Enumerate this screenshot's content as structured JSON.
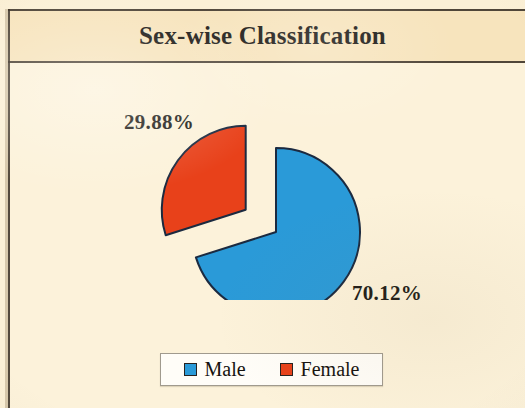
{
  "title": "Sex-wise Classification",
  "colors": {
    "male": "#2a9ad8",
    "female": "#e8411a",
    "slice_outline": "#1b2a40",
    "title_band_bg": "#f7e4bd",
    "plot_bg": "#fcf2da",
    "frame_rule": "#3d3328",
    "legend_bg": "#fffdf8",
    "legend_border": "#a09a8e",
    "text": "#1d1a16"
  },
  "labels": {
    "female_pct": "29.88%",
    "male_pct": "70.12%"
  },
  "legend": {
    "items": [
      {
        "label": "Male",
        "color": "#2a9ad8"
      },
      {
        "label": "Female",
        "color": "#e8411a"
      }
    ]
  },
  "chart_data": {
    "type": "pie",
    "title": "Sex-wise Classification",
    "xlabel": "",
    "ylabel": "",
    "categories": [
      "Male",
      "Female"
    ],
    "values": [
      70.12,
      29.88
    ],
    "value_unit": "percent",
    "data_labels": [
      "70.12%",
      "29.88%"
    ],
    "colors": [
      "#2a9ad8",
      "#e8411a"
    ],
    "legend_position": "bottom",
    "grid": false,
    "exploded_slices": [
      "Female"
    ],
    "start_angle_deg": 0,
    "direction": "clockwise"
  }
}
